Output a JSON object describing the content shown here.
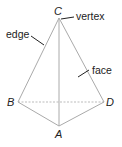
{
  "diagram": {
    "type": "tetrahedron",
    "vertices": [
      {
        "id": "C",
        "label": "C",
        "x": 59,
        "y": 18
      },
      {
        "id": "B",
        "label": "B",
        "x": 18,
        "y": 102
      },
      {
        "id": "D",
        "label": "D",
        "x": 104,
        "y": 102
      },
      {
        "id": "A",
        "label": "A",
        "x": 59,
        "y": 126
      }
    ],
    "edges": [
      {
        "from": "C",
        "to": "B",
        "style": "solid"
      },
      {
        "from": "C",
        "to": "D",
        "style": "solid"
      },
      {
        "from": "C",
        "to": "A",
        "style": "solid"
      },
      {
        "from": "B",
        "to": "A",
        "style": "solid"
      },
      {
        "from": "D",
        "to": "A",
        "style": "solid"
      },
      {
        "from": "B",
        "to": "D",
        "style": "dashed"
      }
    ],
    "annotations": {
      "vertex": "vertex",
      "edge": "edge",
      "face": "face"
    },
    "colors": {
      "edge": "#aaaaaa",
      "text": "#222222"
    }
  }
}
